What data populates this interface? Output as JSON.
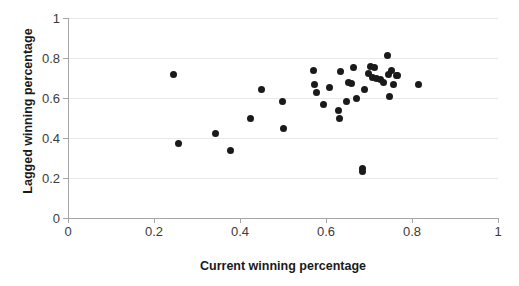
{
  "chart_data": {
    "type": "scatter",
    "title": "",
    "xlabel": "Current winning percentage",
    "ylabel": "Lagged winning percentage",
    "xlim": [
      0,
      1
    ],
    "ylim": [
      0,
      1
    ],
    "xticks": [
      "0",
      "0.2",
      "0.4",
      "0.6",
      "0.8",
      "1"
    ],
    "xtick_values": [
      0,
      0.2,
      0.4,
      0.6,
      0.8,
      1
    ],
    "yticks": [
      "0",
      "0.2",
      "0.4",
      "0.6",
      "0.8",
      "1"
    ],
    "ytick_values": [
      0,
      0.2,
      0.4,
      0.6,
      0.8,
      1
    ],
    "grid": "horizontal",
    "legend": "none",
    "marker_color": "#1a1a1a",
    "marker_shape": "circle",
    "points": [
      {
        "x": 0.246,
        "y": 0.718
      },
      {
        "x": 0.256,
        "y": 0.375
      },
      {
        "x": 0.344,
        "y": 0.423
      },
      {
        "x": 0.379,
        "y": 0.338
      },
      {
        "x": 0.424,
        "y": 0.496
      },
      {
        "x": 0.451,
        "y": 0.644
      },
      {
        "x": 0.498,
        "y": 0.584
      },
      {
        "x": 0.5,
        "y": 0.447
      },
      {
        "x": 0.572,
        "y": 0.74
      },
      {
        "x": 0.574,
        "y": 0.666
      },
      {
        "x": 0.578,
        "y": 0.63
      },
      {
        "x": 0.595,
        "y": 0.57
      },
      {
        "x": 0.607,
        "y": 0.655
      },
      {
        "x": 0.63,
        "y": 0.536
      },
      {
        "x": 0.632,
        "y": 0.496
      },
      {
        "x": 0.634,
        "y": 0.735
      },
      {
        "x": 0.647,
        "y": 0.583
      },
      {
        "x": 0.653,
        "y": 0.68
      },
      {
        "x": 0.66,
        "y": 0.675
      },
      {
        "x": 0.663,
        "y": 0.751
      },
      {
        "x": 0.672,
        "y": 0.596
      },
      {
        "x": 0.684,
        "y": 0.247
      },
      {
        "x": 0.686,
        "y": 0.232
      },
      {
        "x": 0.69,
        "y": 0.645
      },
      {
        "x": 0.698,
        "y": 0.722
      },
      {
        "x": 0.703,
        "y": 0.759
      },
      {
        "x": 0.707,
        "y": 0.705
      },
      {
        "x": 0.712,
        "y": 0.753
      },
      {
        "x": 0.718,
        "y": 0.7
      },
      {
        "x": 0.727,
        "y": 0.692
      },
      {
        "x": 0.734,
        "y": 0.676
      },
      {
        "x": 0.742,
        "y": 0.812
      },
      {
        "x": 0.745,
        "y": 0.718
      },
      {
        "x": 0.748,
        "y": 0.606
      },
      {
        "x": 0.752,
        "y": 0.74
      },
      {
        "x": 0.757,
        "y": 0.668
      },
      {
        "x": 0.763,
        "y": 0.715
      },
      {
        "x": 0.766,
        "y": 0.713
      },
      {
        "x": 0.816,
        "y": 0.666
      }
    ]
  }
}
